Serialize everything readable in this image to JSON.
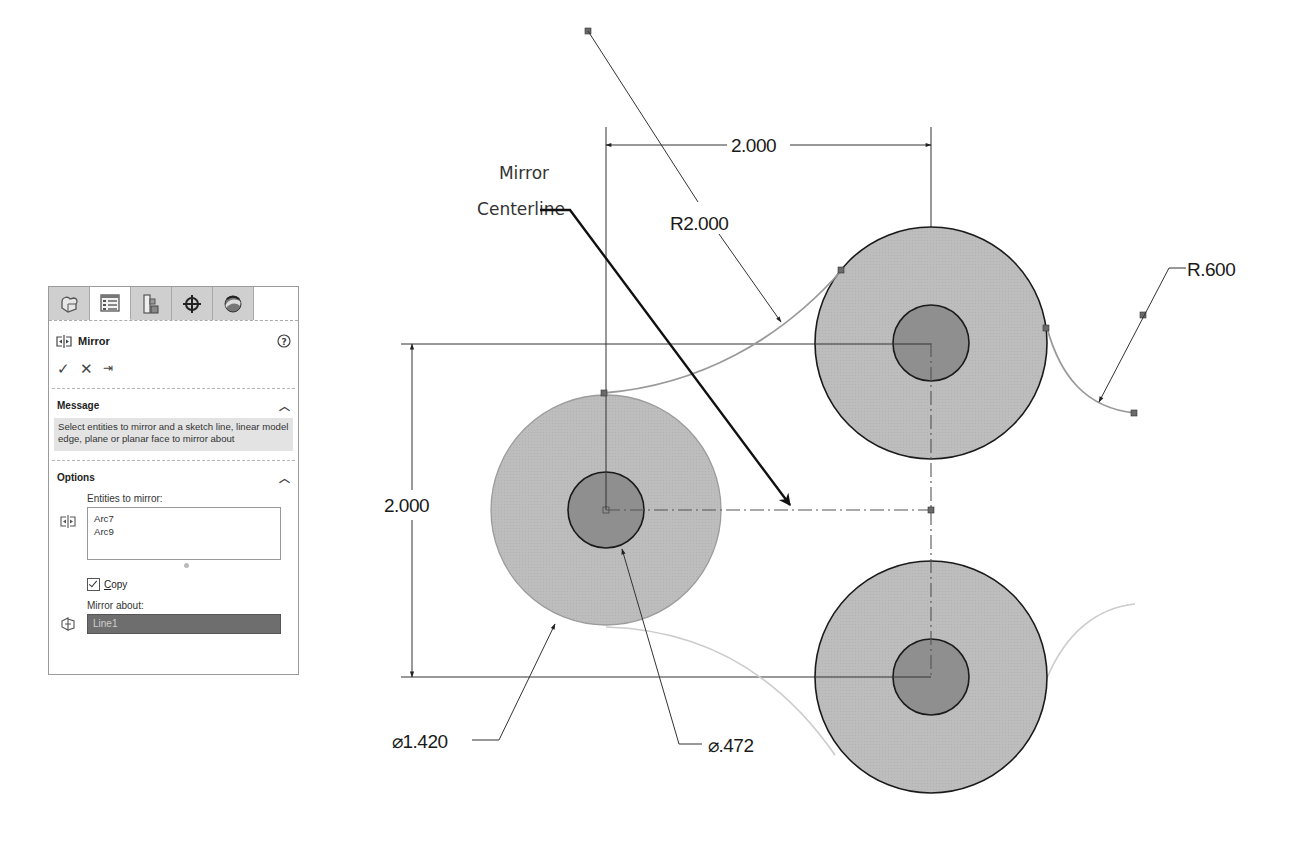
{
  "panel": {
    "tabs": [
      {
        "name": "feature-manager",
        "icon": "part-icon",
        "active": false
      },
      {
        "name": "property-manager",
        "icon": "property-list-icon",
        "active": true
      },
      {
        "name": "configuration-manager",
        "icon": "configuration-icon",
        "active": false
      },
      {
        "name": "dimxpert-manager",
        "icon": "crosshair-icon",
        "active": false
      },
      {
        "name": "display-manager",
        "icon": "appearance-sphere-icon",
        "active": false
      }
    ],
    "title": "Mirror",
    "actions": {
      "ok": "✓",
      "cancel": "✕",
      "pin": "⇥"
    },
    "message": {
      "heading": "Message",
      "text": "Select entities to mirror and a sketch line, linear model edge, plane or planar face to mirror about"
    },
    "options": {
      "heading": "Options",
      "entities_label": "Entities to mirror:",
      "entities": [
        "Arc7",
        "Arc9"
      ],
      "copy_label_prefix": "C",
      "copy_label_rest": "opy",
      "copy_checked": true,
      "mirror_about_label": "Mirror about:",
      "mirror_about_value": "Line1"
    }
  },
  "drawing": {
    "annotation": {
      "line1": "Mirror",
      "line2": "Centerline"
    },
    "dimensions": {
      "horizontal": "2.000",
      "vertical": "2.000",
      "arc_large": "R2.000",
      "arc_small": "R.600",
      "outer_diameter": "⌀1.420",
      "inner_diameter": "⌀.472"
    },
    "colors": {
      "outer_fill": "#bdbdbd",
      "inner_fill": "#8f8f8f",
      "line": "#222222",
      "arc": "#9a9a9a",
      "preview_arc": "#cccccc",
      "point": "#6a6a6a"
    }
  }
}
